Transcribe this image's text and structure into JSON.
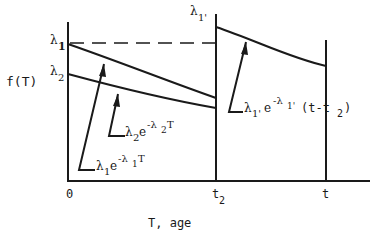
{
  "diagram": {
    "type": "piecewise exponential decay diagram",
    "y_axis_label": "f(T)",
    "x_axis_label": "T, age",
    "x_ticks": [
      "0",
      "t",
      "t"
    ],
    "x_tick_labels": {
      "origin": "0",
      "t2": "t",
      "t2_sub": "2",
      "t": "t"
    },
    "y_ticks": {
      "lambda1": "λ",
      "lambda1_sub": "1",
      "lambda2": "λ",
      "lambda2_sub": "2",
      "lambda1p": "λ",
      "lambda1p_sub": "1'"
    },
    "curves": [
      {
        "name": "curve-1",
        "label_base": "λ",
        "label_sub": "1",
        "label_e": "e",
        "label_exp": "-λ",
        "label_exp_sub": "1",
        "label_exp_tail": "T"
      },
      {
        "name": "curve-2",
        "label_base": "λ",
        "label_sub": "2",
        "label_e": "e",
        "label_exp": "-λ",
        "label_exp_sub": "2",
        "label_exp_tail": "T"
      },
      {
        "name": "curve-1-prime",
        "label_base": "λ",
        "label_sub": "1'",
        "label_e": "e",
        "label_exp": "-λ",
        "label_exp_sub": "1'",
        "label_exp_tail": "(t-t",
        "label_tail_sub": "2",
        "label_close": ")"
      }
    ],
    "colors": {
      "ink": "#1a1a1a",
      "background": "#ffffff"
    }
  }
}
